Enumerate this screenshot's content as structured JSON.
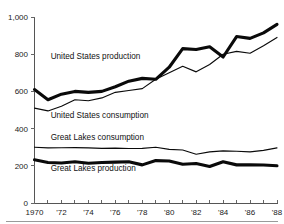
{
  "chart_data": {
    "type": "line",
    "title": "",
    "subtitle": "",
    "xlabel": "",
    "ylabel": "",
    "xlim": [
      1970,
      1988
    ],
    "ylim": [
      0,
      1000
    ],
    "grid": false,
    "legend_position": "inline-labels",
    "x": [
      1970,
      1971,
      1972,
      1973,
      1974,
      1975,
      1976,
      1977,
      1978,
      1979,
      1980,
      1981,
      1982,
      1983,
      1984,
      1985,
      1986,
      1987,
      1988
    ],
    "x_tick_labels": [
      "1970",
      "'72",
      "'74",
      "'76",
      "'78",
      "'80",
      "'82",
      "'84",
      "'86",
      "'88"
    ],
    "x_tick_values": [
      1970,
      1972,
      1974,
      1976,
      1978,
      1980,
      1982,
      1984,
      1986,
      1988
    ],
    "y_tick_labels": [
      "0",
      "200",
      "400",
      "600",
      "800",
      "1,000"
    ],
    "y_tick_values": [
      0,
      200,
      400,
      600,
      800,
      1000
    ],
    "series": [
      {
        "name": "United States production",
        "style": "thick",
        "color": "#0a0a0a",
        "label_text": "United States production",
        "values": [
          610,
          555,
          585,
          600,
          595,
          600,
          625,
          655,
          670,
          665,
          730,
          830,
          825,
          840,
          785,
          895,
          885,
          915,
          960
        ]
      },
      {
        "name": "United States consumption",
        "style": "thin",
        "color": "#0a0a0a",
        "label_text": "United States consumption",
        "values": [
          510,
          495,
          520,
          555,
          550,
          565,
          595,
          605,
          615,
          665,
          700,
          735,
          705,
          745,
          800,
          815,
          805,
          845,
          890
        ]
      },
      {
        "name": "Great Lakes consumption",
        "style": "thin",
        "color": "#0a0a0a",
        "label_text": "Great Lakes consumption",
        "values": [
          300,
          296,
          297,
          298,
          296,
          294,
          295,
          293,
          294,
          300,
          288,
          285,
          262,
          275,
          280,
          278,
          275,
          283,
          296
        ]
      },
      {
        "name": "Great Lakes production",
        "style": "thick",
        "color": "#0a0a0a",
        "label_text": "Great Lakes production",
        "values": [
          232,
          218,
          215,
          222,
          214,
          218,
          220,
          222,
          205,
          228,
          226,
          208,
          212,
          196,
          222,
          205,
          205,
          204,
          200
        ]
      }
    ],
    "annotations": [
      {
        "name": "us-production-label",
        "text": "United States production",
        "x": 1971.2,
        "y": 772
      },
      {
        "name": "us-consumption-label",
        "text": "United States consumption",
        "x": 1971.2,
        "y": 455
      },
      {
        "name": "gl-consumption-label",
        "text": "Great Lakes consumption",
        "x": 1971.2,
        "y": 338
      },
      {
        "name": "gl-production-label",
        "text": "Great Lakes production",
        "x": 1971.2,
        "y": 172
      }
    ],
    "colors": {
      "background": "#ffffff",
      "ink": "#0a0a0a",
      "axis": "#555555",
      "rule": "#9a9a9a"
    }
  }
}
